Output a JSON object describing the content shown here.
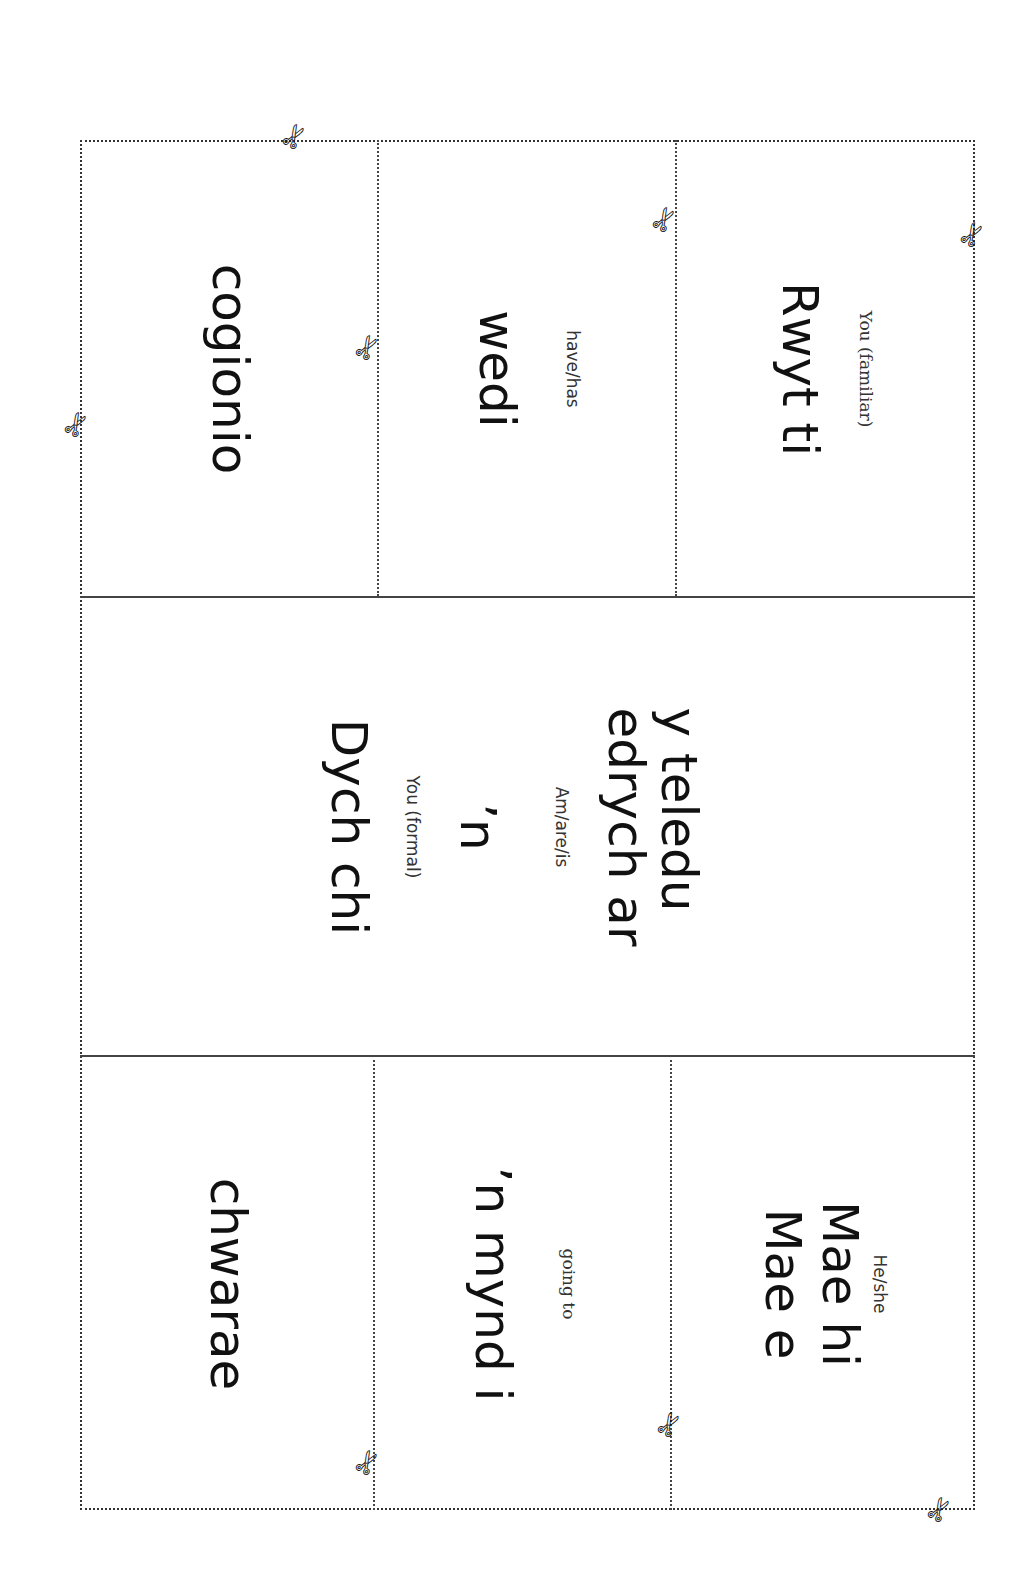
{
  "worksheet": {
    "layout": "3x3 cut-out cards, printed rotated 90 degrees",
    "cards": {
      "r1c1": {
        "word": "Rwyt ti",
        "gloss": "You (familiar)"
      },
      "r1c2": {
        "word": "wedi",
        "gloss": "have/has"
      },
      "r1c3": {
        "word": "cogionio",
        "gloss": ""
      },
      "r2": {
        "subject": {
          "word": "Dych chi",
          "gloss": "You (formal)"
        },
        "verb": {
          "word": "’n",
          "gloss": "Am/are/is"
        },
        "activity": {
          "line1": "edrych ar",
          "line2": "y teledu"
        }
      },
      "r3c1": {
        "line1": "Mae e",
        "line2": "Mae hi",
        "gloss": "He/she"
      },
      "r3c2": {
        "word": "’n mynd i",
        "gloss": "going to"
      },
      "r3c3": {
        "word": "chwarae",
        "gloss": ""
      }
    },
    "icons": {
      "scissors": "✄"
    }
  }
}
